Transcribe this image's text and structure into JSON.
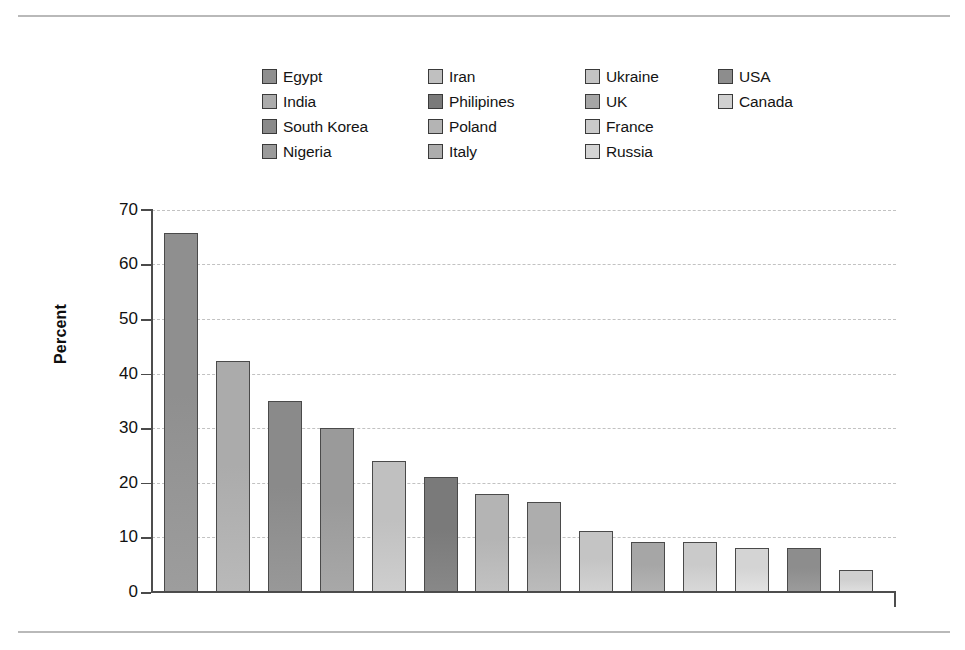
{
  "figure": {
    "y_axis_title": "Percent"
  },
  "legend": {
    "columns": [
      {
        "items": [
          {
            "label": "Egypt",
            "color": "#8f8f8f"
          },
          {
            "label": "India",
            "color": "#ababab"
          },
          {
            "label": "South Korea",
            "color": "#8a8a8a"
          },
          {
            "label": "Nigeria",
            "color": "#9a9a9a"
          }
        ]
      },
      {
        "items": [
          {
            "label": "Iran",
            "color": "#c0c0c0"
          },
          {
            "label": "Philipines",
            "color": "#7a7a7a"
          },
          {
            "label": "Poland",
            "color": "#b4b4b4"
          },
          {
            "label": "Italy",
            "color": "#adadad"
          }
        ]
      },
      {
        "items": [
          {
            "label": "Ukraine",
            "color": "#c4c4c4"
          },
          {
            "label": "UK",
            "color": "#a6a6a6"
          },
          {
            "label": "France",
            "color": "#cacaca"
          },
          {
            "label": "Russia",
            "color": "#d4d4d4"
          }
        ]
      },
      {
        "items": [
          {
            "label": "USA",
            "color": "#8d8d8d"
          },
          {
            "label": "Canada",
            "color": "#d0d0d0"
          }
        ]
      }
    ]
  },
  "chart_data": {
    "type": "bar",
    "title": "",
    "xlabel": "",
    "ylabel": "Percent",
    "ylim": [
      0,
      70
    ],
    "yticks": [
      0,
      10,
      20,
      30,
      40,
      50,
      60,
      70
    ],
    "ytick_labels": [
      "0",
      "10",
      "20",
      "30",
      "40",
      "50",
      "60",
      "70"
    ],
    "grid": "horizontal-dotted",
    "legend_position": "above-plot",
    "categories": [
      "Egypt",
      "India",
      "South Korea",
      "Nigeria",
      "Iran",
      "Philipines",
      "Poland",
      "Italy",
      "Ukraine",
      "UK",
      "France",
      "Russia",
      "USA",
      "Canada"
    ],
    "values": [
      65.8,
      42.3,
      35.0,
      30.0,
      24.0,
      21.0,
      18.0,
      16.5,
      11.2,
      9.2,
      9.2,
      8.1,
      8.1,
      4.1
    ],
    "colors": [
      "#8f8f8f",
      "#ababab",
      "#8a8a8a",
      "#9a9a9a",
      "#c0c0c0",
      "#7a7a7a",
      "#b4b4b4",
      "#adadad",
      "#c4c4c4",
      "#a6a6a6",
      "#cacaca",
      "#d4d4d4",
      "#8d8d8d",
      "#d0d0d0"
    ]
  }
}
